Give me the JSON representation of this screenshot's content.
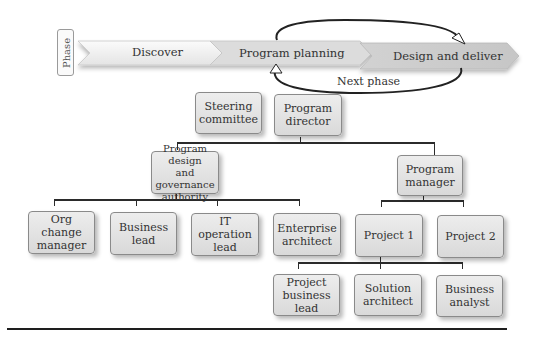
{
  "phase_bar": {
    "label": "Phase",
    "phases": [
      {
        "label": "Discover"
      },
      {
        "label": "Program planning"
      },
      {
        "label": "Design and deliver"
      }
    ],
    "cycle_label": "Next phase"
  },
  "org_chart": {
    "top": [
      {
        "label_lines": [
          "Steering",
          "committee"
        ]
      },
      {
        "label_lines": [
          "Program",
          "director"
        ]
      }
    ],
    "second": [
      {
        "label_lines": [
          "Program design",
          "and governance",
          "authority"
        ]
      },
      {
        "label_lines": [
          "Program",
          "manager"
        ]
      }
    ],
    "governance_reports": [
      {
        "label_lines": [
          "Org change",
          "manager"
        ]
      },
      {
        "label_lines": [
          "Business",
          "lead"
        ]
      },
      {
        "label_lines": [
          "IT operation",
          "lead"
        ]
      },
      {
        "label_lines": [
          "Enterprise",
          "architect"
        ]
      }
    ],
    "projects": [
      {
        "label_lines": [
          "Project 1"
        ]
      },
      {
        "label_lines": [
          "Project 2"
        ]
      }
    ],
    "project_roles": [
      {
        "label_lines": [
          "Project",
          "business lead"
        ]
      },
      {
        "label_lines": [
          "Solution",
          "architect"
        ]
      },
      {
        "label_lines": [
          "Business",
          "analyst"
        ]
      }
    ]
  }
}
